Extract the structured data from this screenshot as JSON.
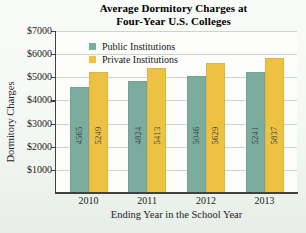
{
  "figure": {
    "title_line1": "Average Dormitory Charges at",
    "title_line2": "Four-Year U.S. Colleges"
  },
  "chart_data": {
    "type": "bar",
    "categories": [
      "2010",
      "2011",
      "2012",
      "2013"
    ],
    "series": [
      {
        "name": "Public Institutions",
        "color": "#7bac9e",
        "values": [
          4565,
          4824,
          5046,
          5241
        ]
      },
      {
        "name": "Private Institutions",
        "color": "#edc242",
        "values": [
          5249,
          5413,
          5629,
          5837
        ]
      }
    ],
    "xlabel": "Ending Year in the School Year",
    "ylabel": "Dormitory Charges",
    "ylim": [
      0,
      7000
    ],
    "y_tick_step": 1000,
    "y_tick_labels": [
      "$1000",
      "$2000",
      "$3000",
      "$4000",
      "$5000",
      "$6000",
      "$7000"
    ],
    "grid": true,
    "legend_position": "top-left-inside",
    "bar_value_labels": "rotated-90-inside-bars"
  },
  "colors": {
    "public_bar": "#7bac9e",
    "private_bar": "#edc242",
    "gridline": "#ccd4ce",
    "axis": "#3f4240",
    "text": "#1f2322"
  }
}
